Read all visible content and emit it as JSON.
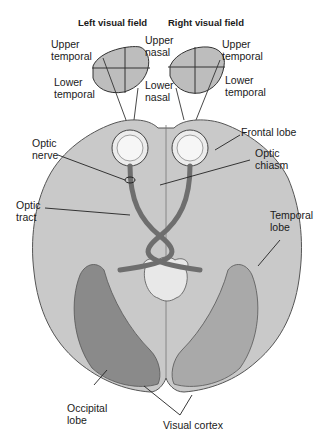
{
  "figure": {
    "title_left": "Left visual field",
    "title_right": "Right visual field",
    "labels": {
      "left_upper_temporal": "Upper\ntemporal",
      "left_lower_temporal": "Lower\ntemporal",
      "right_upper_nasal": "Upper\nnasal",
      "right_lower_nasal": "Lower\nnasal",
      "right_upper_temporal": "Upper\ntemporal",
      "right_lower_temporal": "Lower\ntemporal",
      "optic_nerve": "Optic\nnerve",
      "optic_tract": "Optic\ntract",
      "frontal_lobe": "Frontal lobe",
      "optic_chiasm": "Optic\nchiasm",
      "temporal_lobe": "Temporal\nlobe",
      "occipital_lobe": "Occipital\nlobe",
      "visual_cortex": "Visual cortex"
    },
    "colors": {
      "brain_fill": "#c9c9c9",
      "field_fill": "#bdbdbd",
      "tract_fill": "#6e6e6e",
      "cortex_left": "#8a8a8a",
      "cortex_right": "#a9a9a9",
      "outline": "#4a4a4a"
    }
  }
}
